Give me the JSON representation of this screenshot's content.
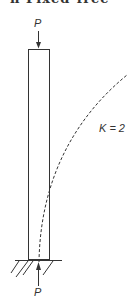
{
  "figure": {
    "title_clipped": "n  Fixed-free",
    "load_top_label": "P",
    "load_bottom_label": "P",
    "curve_label": "K = 2",
    "colors": {
      "line": "#333333",
      "background": "#ffffff"
    }
  }
}
